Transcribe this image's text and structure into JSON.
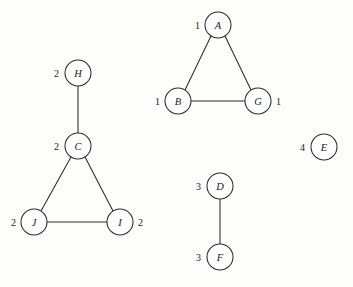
{
  "diagram": {
    "background_color": "#fdfdfb",
    "stroke_color": "#2b2b2b",
    "node_fill_color": "#ffffff",
    "node_radius": 13,
    "width": 353,
    "height": 287,
    "nodes": [
      {
        "id": "A",
        "label": "A",
        "annotation": "1",
        "annotation_side": "left",
        "cx": 218,
        "cy": 25,
        "ax": 200,
        "ay": 25
      },
      {
        "id": "B",
        "label": "B",
        "annotation": "1",
        "annotation_side": "left",
        "cx": 178,
        "cy": 101,
        "ax": 160,
        "ay": 101
      },
      {
        "id": "G",
        "label": "G",
        "annotation": "1",
        "annotation_side": "right",
        "cx": 258,
        "cy": 101,
        "ax": 276,
        "ay": 101
      },
      {
        "id": "H",
        "label": "H",
        "annotation": "2",
        "annotation_side": "left",
        "cx": 78,
        "cy": 73,
        "ax": 59,
        "ay": 73
      },
      {
        "id": "C",
        "label": "C",
        "annotation": "2",
        "annotation_side": "left",
        "cx": 78,
        "cy": 146,
        "ax": 59,
        "ay": 146
      },
      {
        "id": "J",
        "label": "J",
        "annotation": "2",
        "annotation_side": "left",
        "cx": 34,
        "cy": 222,
        "ax": 16,
        "ay": 222
      },
      {
        "id": "I",
        "label": "I",
        "annotation": "2",
        "annotation_side": "right",
        "cx": 120,
        "cy": 222,
        "ax": 138,
        "ay": 222
      },
      {
        "id": "D",
        "label": "D",
        "annotation": "3",
        "annotation_side": "left",
        "cx": 220,
        "cy": 186,
        "ax": 201,
        "ay": 186
      },
      {
        "id": "F",
        "label": "F",
        "annotation": "3",
        "annotation_side": "left",
        "cx": 220,
        "cy": 257,
        "ax": 201,
        "ay": 257
      },
      {
        "id": "E",
        "label": "E",
        "annotation": "4",
        "annotation_side": "left",
        "cx": 324,
        "cy": 147,
        "ax": 305,
        "ay": 147
      }
    ],
    "edges": [
      {
        "from": "A",
        "to": "B",
        "x1": 211,
        "y1": 36,
        "x2": 185,
        "y2": 90
      },
      {
        "from": "A",
        "to": "G",
        "x1": 225,
        "y1": 36,
        "x2": 251,
        "y2": 90
      },
      {
        "from": "B",
        "to": "G",
        "x1": 191,
        "y1": 101,
        "x2": 245,
        "y2": 101
      },
      {
        "from": "H",
        "to": "C",
        "x1": 78,
        "y1": 86,
        "x2": 78,
        "y2": 133
      },
      {
        "from": "C",
        "to": "J",
        "x1": 71,
        "y1": 157,
        "x2": 41,
        "y2": 211
      },
      {
        "from": "C",
        "to": "I",
        "x1": 85,
        "y1": 157,
        "x2": 113,
        "y2": 211
      },
      {
        "from": "J",
        "to": "I",
        "x1": 47,
        "y1": 222,
        "x2": 107,
        "y2": 222
      },
      {
        "from": "D",
        "to": "F",
        "x1": 220,
        "y1": 199,
        "x2": 220,
        "y2": 244
      }
    ],
    "components": [
      {
        "id": "1",
        "members": [
          "A",
          "B",
          "G"
        ]
      },
      {
        "id": "2",
        "members": [
          "H",
          "C",
          "J",
          "I"
        ]
      },
      {
        "id": "3",
        "members": [
          "D",
          "F"
        ]
      },
      {
        "id": "4",
        "members": [
          "E"
        ]
      }
    ]
  }
}
